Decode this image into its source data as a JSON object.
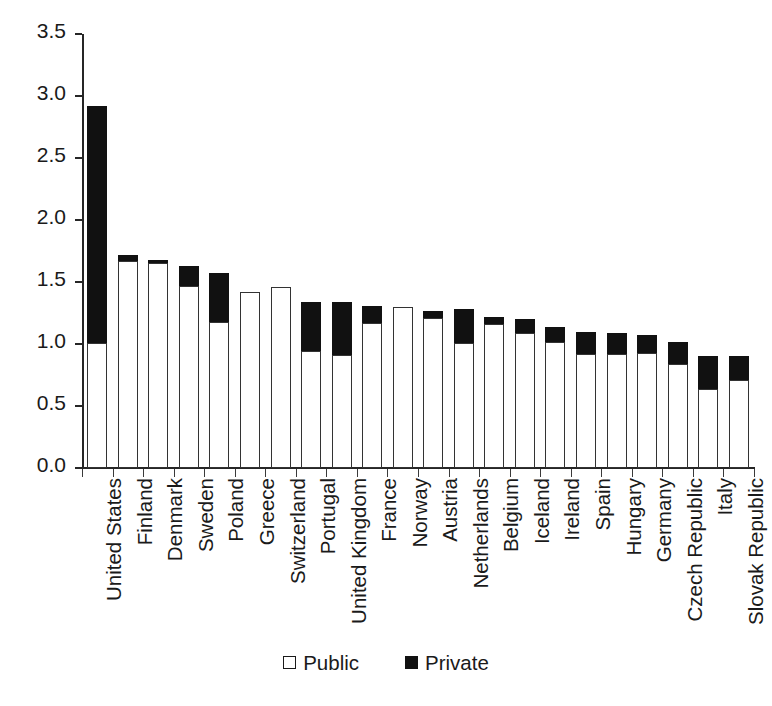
{
  "chart_data": {
    "type": "bar",
    "subtype": "stacked-bar",
    "title": "",
    "subtitle": "",
    "xlabel": "",
    "ylabel": "",
    "ylim": [
      0.0,
      3.5
    ],
    "ytick_labels": [
      "0.0",
      "0.5",
      "1.0",
      "1.5",
      "2.0",
      "2.5",
      "3.0",
      "3.5"
    ],
    "ytick_values": [
      0.0,
      0.5,
      1.0,
      1.5,
      2.0,
      2.5,
      3.0,
      3.5
    ],
    "grid": false,
    "legend_position": "bottom-center",
    "categories": [
      "United States",
      "Finland",
      "Denmark",
      "Sweden",
      "Poland",
      "Greece",
      "Switzerland",
      "Portugal",
      "United Kingdom",
      "France",
      "Norway",
      "Austria",
      "Netherlands",
      "Belgium",
      "Iceland",
      "Ireland",
      "Spain",
      "Hungary",
      "Germany",
      "Czech Republic",
      "Italy",
      "Slovak Republic"
    ],
    "series": [
      {
        "name": "Public",
        "color": "#ffffff",
        "values": [
          1.01,
          1.67,
          1.65,
          1.47,
          1.18,
          1.42,
          1.46,
          0.94,
          0.91,
          1.17,
          1.3,
          1.21,
          1.01,
          1.16,
          1.09,
          1.02,
          0.92,
          0.92,
          0.93,
          0.84,
          0.64,
          0.71
        ]
      },
      {
        "name": "Private",
        "color": "#111111",
        "values": [
          1.91,
          0.05,
          0.03,
          0.16,
          0.39,
          0.0,
          0.0,
          0.4,
          0.43,
          0.14,
          0.0,
          0.06,
          0.27,
          0.06,
          0.11,
          0.12,
          0.18,
          0.17,
          0.14,
          0.18,
          0.26,
          0.19
        ]
      }
    ],
    "totals": [
      2.92,
      1.72,
      1.68,
      1.63,
      1.57,
      1.42,
      1.46,
      1.34,
      1.34,
      1.31,
      1.3,
      1.27,
      1.28,
      1.22,
      1.2,
      1.14,
      1.1,
      1.09,
      1.07,
      1.02,
      0.9,
      0.9
    ],
    "legend": [
      {
        "label": "Public",
        "marker": "open-square"
      },
      {
        "label": "Private",
        "marker": "filled-square"
      }
    ]
  }
}
